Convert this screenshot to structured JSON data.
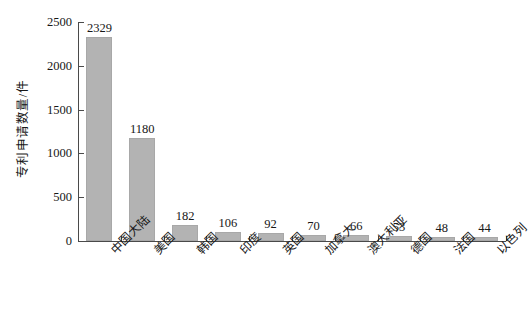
{
  "chart_data": {
    "type": "bar",
    "title": "",
    "xlabel": "",
    "ylabel": "专利申请数量/件",
    "ylim": [
      0,
      2500
    ],
    "ytick_labels": [
      "0",
      "500",
      "1000",
      "1500",
      "2000",
      "2500"
    ],
    "ytick_values": [
      0,
      500,
      1000,
      1500,
      2000,
      2500
    ],
    "grid": false,
    "legend": "none",
    "bar_color": "#b3b3b3",
    "axis_color": "#4a4a4a",
    "background": "#ffffff",
    "categories": [
      "中国大陆",
      "美国",
      "韩国",
      "印度",
      "英国",
      "加拿大",
      "澳大利亚",
      "德国",
      "法国",
      "以色列"
    ],
    "values": [
      2329,
      1180,
      182,
      106,
      92,
      70,
      66,
      53,
      48,
      44
    ],
    "value_labels": [
      "2329",
      "1180",
      "182",
      "106",
      "92",
      "70",
      "66",
      "53",
      "48",
      "44"
    ]
  }
}
